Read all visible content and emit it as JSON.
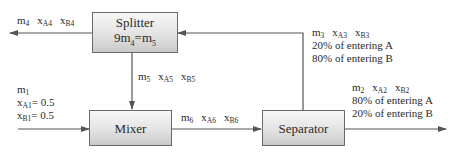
{
  "diagram": {
    "type": "process-flow",
    "units": {
      "splitter": {
        "name": "Splitter",
        "relation": {
          "lhs_coef": "9",
          "lhs_var": "m",
          "lhs_sub": "4",
          "eq": "=",
          "rhs_var": "m",
          "rhs_sub": "5"
        }
      },
      "mixer": {
        "name": "Mixer"
      },
      "separator": {
        "name": "Separator"
      }
    },
    "streams": {
      "s1": {
        "m": "m",
        "m_sub": "1",
        "xa": "x",
        "xa_sub": "A1",
        "xa_val": "= 0.5",
        "xb": "x",
        "xb_sub": "B1",
        "xb_val": "= 0.5"
      },
      "s2": {
        "m": "m",
        "m_sub": "2",
        "xa": "x",
        "xa_sub": "A2",
        "xb": "x",
        "xb_sub": "B2",
        "note_a": "80% of entering A",
        "note_b": "20% of entering B"
      },
      "s3": {
        "m": "m",
        "m_sub": "3",
        "xa": "x",
        "xa_sub": "A3",
        "xb": "x",
        "xb_sub": "B3",
        "note_a": "20% of entering A",
        "note_b": "80% of entering B"
      },
      "s4": {
        "m": "m",
        "m_sub": "4",
        "xa": "x",
        "xa_sub": "A4",
        "xb": "x",
        "xb_sub": "B4"
      },
      "s5": {
        "m": "m",
        "m_sub": "5",
        "xa": "x",
        "xa_sub": "A5",
        "xb": "x",
        "xb_sub": "B5"
      },
      "s6": {
        "m": "m",
        "m_sub": "6",
        "xa": "x",
        "xa_sub": "A6",
        "xb": "x",
        "xb_sub": "B6"
      }
    },
    "colors": {
      "line": "#555555",
      "box_border": "#6a6a6a",
      "box_top": "#f7f7f7",
      "box_bottom": "#c9c9c9"
    }
  }
}
